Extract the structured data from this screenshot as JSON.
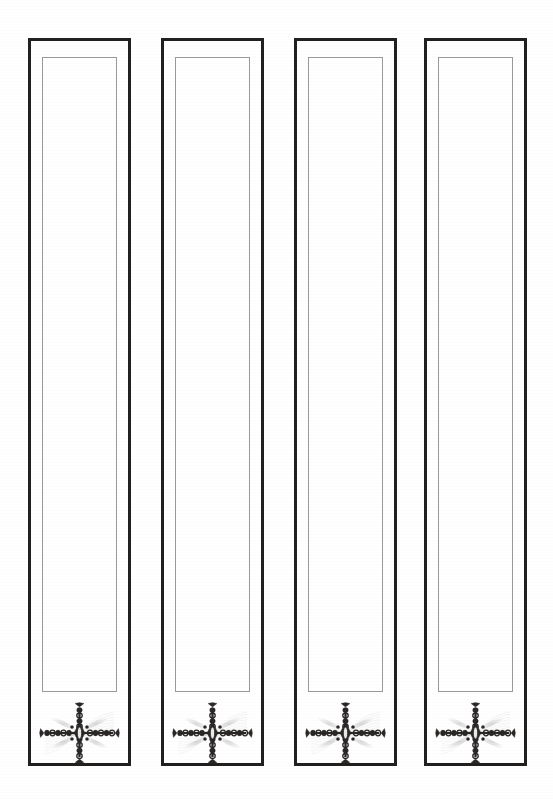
{
  "page": {
    "width": 553,
    "height": 799,
    "background_color": "#ffffff"
  },
  "style": {
    "outer_frame_color": "#221f1f",
    "outer_frame_width_px": 3,
    "inner_rule_color": "#9a9a9a",
    "inner_rule_width_px": 1,
    "ornament_ink_color": "#2a2726",
    "ornament_shadow_color": "#b9b9b9"
  },
  "panels": [
    {
      "index": 1,
      "label": "Panel 1",
      "ornament_name": "cross-fleuron-ornament",
      "geometry": {
        "x": 28,
        "y": 38,
        "width": 103,
        "height": 728
      },
      "inner_geometry": {
        "x": 14,
        "y": 19,
        "width": 75,
        "height": 635
      },
      "ornament_geometry": {
        "x": 10,
        "y": 664,
        "width": 83,
        "height": 62
      }
    },
    {
      "index": 2,
      "label": "Panel 2",
      "ornament_name": "cross-fleuron-ornament",
      "geometry": {
        "x": 161,
        "y": 38,
        "width": 103,
        "height": 728
      },
      "inner_geometry": {
        "x": 14,
        "y": 19,
        "width": 75,
        "height": 635
      },
      "ornament_geometry": {
        "x": 10,
        "y": 664,
        "width": 83,
        "height": 62
      }
    },
    {
      "index": 3,
      "label": "Panel 3",
      "ornament_name": "cross-fleuron-ornament",
      "geometry": {
        "x": 294,
        "y": 38,
        "width": 103,
        "height": 728
      },
      "inner_geometry": {
        "x": 14,
        "y": 19,
        "width": 75,
        "height": 635
      },
      "ornament_geometry": {
        "x": 10,
        "y": 664,
        "width": 83,
        "height": 62
      }
    },
    {
      "index": 4,
      "label": "Panel 4",
      "ornament_name": "cross-fleuron-ornament",
      "geometry": {
        "x": 424,
        "y": 38,
        "width": 103,
        "height": 728
      },
      "inner_geometry": {
        "x": 14,
        "y": 19,
        "width": 75,
        "height": 635
      },
      "ornament_geometry": {
        "x": 10,
        "y": 664,
        "width": 83,
        "height": 62
      }
    }
  ]
}
